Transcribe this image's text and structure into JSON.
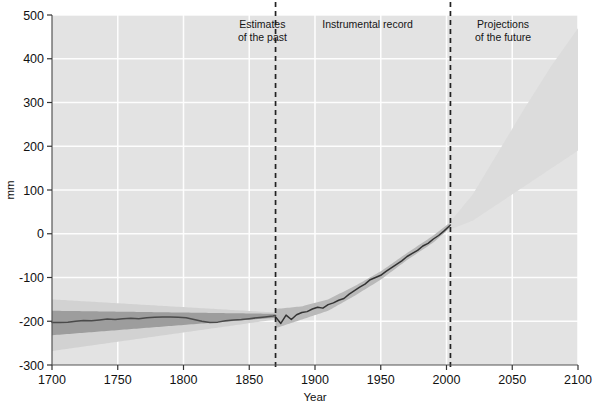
{
  "chart_data": {
    "type": "line",
    "title": "",
    "xlabel": "Year",
    "ylabel": "mm",
    "xlim": [
      1700,
      2100
    ],
    "ylim": [
      -300,
      500
    ],
    "xticks": [
      1700,
      1750,
      1800,
      1850,
      1900,
      1950,
      2000,
      2050,
      2100
    ],
    "xtick_labels": [
      "1700",
      "1750",
      "1800",
      "1850",
      "1900",
      "1950",
      "2000",
      "2050",
      "2100"
    ],
    "yticks": [
      -300,
      -200,
      -100,
      0,
      100,
      200,
      300,
      400,
      500
    ],
    "ytick_labels": [
      "-300",
      "-200",
      "-100",
      "0",
      "100",
      "200",
      "300",
      "400",
      "500"
    ],
    "grid": true,
    "grid_color": "#ffffff",
    "plot_background": "#e3e3e3",
    "legend_position": "none",
    "annotations": [
      {
        "name": "estimates-of-the-past",
        "lines": [
          "Estimates",
          "of the past"
        ],
        "x": 1860,
        "y": 470,
        "anchor": "end"
      },
      {
        "name": "instrumental-record",
        "lines": [
          "Instrumental record"
        ],
        "x": 1940,
        "y": 470,
        "anchor": "middle"
      },
      {
        "name": "projections-of-the-future",
        "lines": [
          "Projections",
          "of the future"
        ],
        "x": 2043,
        "y": 470,
        "anchor": "middle"
      }
    ],
    "dividers": [
      {
        "name": "divider-1870",
        "x": 1870,
        "style": "dashed",
        "color": "#222222"
      },
      {
        "name": "divider-2003",
        "x": 2003,
        "style": "dashed",
        "color": "#222222"
      }
    ],
    "series": [
      {
        "name": "Reconstructed sea level",
        "type": "line",
        "color": "#4a4a4a",
        "x": [
          1700,
          1706,
          1712,
          1718,
          1724,
          1730,
          1736,
          1742,
          1748,
          1754,
          1760,
          1766,
          1772,
          1778,
          1784,
          1790,
          1796,
          1802,
          1808,
          1814,
          1820,
          1826,
          1832,
          1838,
          1844,
          1850,
          1856,
          1862,
          1868,
          1870
        ],
        "values": [
          -203,
          -203,
          -202,
          -200,
          -198,
          -199,
          -197,
          -195,
          -196,
          -194,
          -193,
          -194,
          -192,
          -191,
          -190,
          -190,
          -191,
          -192,
          -196,
          -200,
          -203,
          -202,
          -199,
          -197,
          -196,
          -194,
          -192,
          -190,
          -188,
          -187
        ]
      },
      {
        "name": "Instrumental sea level",
        "type": "line",
        "color": "#333333",
        "x": [
          1870,
          1874,
          1878,
          1882,
          1886,
          1890,
          1894,
          1898,
          1902,
          1906,
          1910,
          1914,
          1918,
          1922,
          1926,
          1930,
          1934,
          1938,
          1942,
          1946,
          1950,
          1954,
          1958,
          1962,
          1966,
          1970,
          1974,
          1978,
          1982,
          1986,
          1990,
          1994,
          1998,
          2003
        ],
        "values": [
          -190,
          -205,
          -186,
          -196,
          -185,
          -180,
          -178,
          -172,
          -168,
          -170,
          -162,
          -158,
          -152,
          -148,
          -138,
          -130,
          -122,
          -115,
          -105,
          -100,
          -95,
          -86,
          -78,
          -70,
          -62,
          -52,
          -45,
          -38,
          -28,
          -22,
          -12,
          -4,
          6,
          20
        ]
      }
    ],
    "bands": [
      {
        "name": "reconstruction-outer-uncertainty",
        "color": "#d2d2d2",
        "x": [
          1700,
          1870
        ],
        "upper": [
          -150,
          -180
        ],
        "lower": [
          -268,
          -196
        ]
      },
      {
        "name": "reconstruction-inner-uncertainty",
        "color": "#9d9d9d",
        "x": [
          1700,
          1870
        ],
        "upper": [
          -176,
          -183
        ],
        "lower": [
          -232,
          -192
        ]
      },
      {
        "name": "instrumental-uncertainty",
        "color": "#b9b9b9",
        "x": [
          1870,
          1890,
          1910,
          1930,
          1950,
          1970,
          1990,
          2003
        ],
        "upper": [
          -172,
          -166,
          -150,
          -120,
          -86,
          -44,
          -4,
          26
        ],
        "lower": [
          -216,
          -196,
          -176,
          -142,
          -105,
          -60,
          -20,
          14
        ]
      },
      {
        "name": "projection-cone",
        "color": "#dcdcdc",
        "x": [
          2003,
          2020,
          2040,
          2060,
          2080,
          2100
        ],
        "upper": [
          28,
          90,
          190,
          290,
          385,
          470
        ],
        "lower": [
          10,
          30,
          70,
          110,
          150,
          190
        ]
      }
    ]
  },
  "axis": {
    "y_title": "mm",
    "x_title": "Year"
  }
}
